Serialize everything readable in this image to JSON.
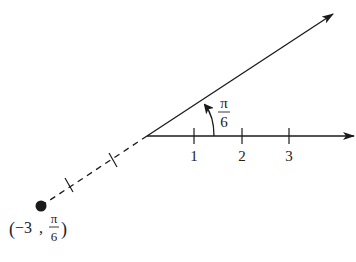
{
  "diagram": {
    "colors": {
      "stroke": "#1a1a1a",
      "text": "#222222",
      "background": "#ffffff"
    },
    "polar_axis": {
      "tick_labels": [
        "1",
        "2",
        "3"
      ]
    },
    "ray": {
      "angle_label_num": "π",
      "angle_label_den": "6"
    },
    "point": {
      "label_open": "(",
      "label_r": "−3",
      "label_sep": ",",
      "label_theta_num": "π",
      "label_theta_den": "6",
      "label_close": ")"
    }
  }
}
